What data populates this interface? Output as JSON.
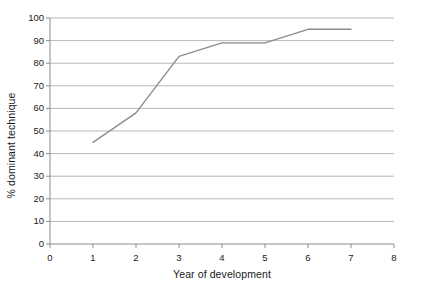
{
  "chart_data": {
    "type": "line",
    "title": "",
    "xlabel": "Year of development",
    "ylabel": "% dominant technique",
    "x": [
      1,
      2,
      3,
      4,
      5,
      6,
      7
    ],
    "values": [
      45,
      58,
      83,
      89,
      89,
      95,
      95
    ],
    "series": [
      {
        "name": "% dominant technique",
        "x": [
          1,
          2,
          3,
          4,
          5,
          6,
          7
        ],
        "values": [
          45,
          58,
          83,
          89,
          89,
          95,
          95
        ]
      }
    ],
    "xlim": [
      0,
      8
    ],
    "ylim": [
      0,
      100
    ],
    "xticks": [
      0,
      1,
      2,
      3,
      4,
      5,
      6,
      7,
      8
    ],
    "xtick_labels": [
      "0",
      "1",
      "2",
      "3",
      "4",
      "5",
      "6",
      "7",
      "8"
    ],
    "yticks": [
      0,
      10,
      20,
      30,
      40,
      50,
      60,
      70,
      80,
      90,
      100
    ],
    "ytick_labels": [
      "0",
      "10",
      "20",
      "30",
      "40",
      "50",
      "60",
      "70",
      "80",
      "90",
      "100"
    ],
    "grid": {
      "horizontal": true,
      "vertical": false,
      "color": "#a6a6a6"
    },
    "legend": {
      "visible": false,
      "position": "none"
    },
    "line_color": "#8c8c8c",
    "line_width": 1.4,
    "markers": false,
    "axis_color": "#7f7f7f",
    "background_color": "#ffffff",
    "text_color": "#1a1a1a"
  }
}
